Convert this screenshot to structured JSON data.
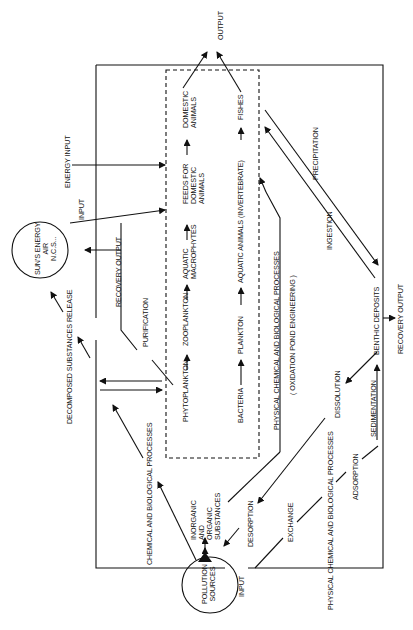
{
  "diagram": {
    "colors": {
      "ink": "#111111",
      "background": "#ffffff"
    },
    "nodes": {
      "output_top": "OUTPUT",
      "energy_input": "ENERGY INPUT",
      "input_upper": "INPUT",
      "suns_energy": "SUN'S ENERGY\nAIR\nN.C.S...",
      "recovery_output_left": "RECOVERY OUTPUT",
      "purification": "PURIFICATION",
      "decomposed_release": "DECOMPOSED SUBSTANCES RELEASE",
      "chem_bio_left": "CHEMICAL  AND BIOLOGICAL PROCESSES",
      "pollution_sources": "POLLUTION\nSOURCES",
      "input_lower": "INPUT",
      "inorganic_organic": "INORGANIC\nAND\nORGANIC\nSUBSTANCES",
      "desorption": "DESORPTION",
      "exchange": "EXCHANGE",
      "phys_chem_bio_bottom": "PHYSICAL CHEMICAL AND BIOLOGICAL PROCESSES",
      "adsorption": "ADSORPTION",
      "sedimentation": "SEDIMENTATION",
      "dissolution": "DISSOLUTION",
      "benthic_deposits": "BENTHIC DEPOSITS",
      "recovery_output_right": "RECOVERY OUTPUT",
      "ingestion": "INGESTION",
      "precipitation": "PRECIPITATION",
      "phys_chem_bio_inner": "PHYSICAL CHEMICAL  AND BIOLOGICAL PROCESSES",
      "oxidation_pond": "( OXIDATION POND ENGINEERING )"
    },
    "food_chain_1": [
      "PHYTOPLANKTON",
      "ZOOPLANKTON",
      "AQUATIC\nMACROPHYTES",
      "FEEDS FOR\nDOMESTIC\nANIMALS",
      "DOMESTIC\nANIMALS"
    ],
    "food_chain_2": [
      "BACTERIA",
      "PLANKTON",
      "AQUATIC ANIMALS  (INVERTEBRATE)",
      "FISHES"
    ]
  }
}
